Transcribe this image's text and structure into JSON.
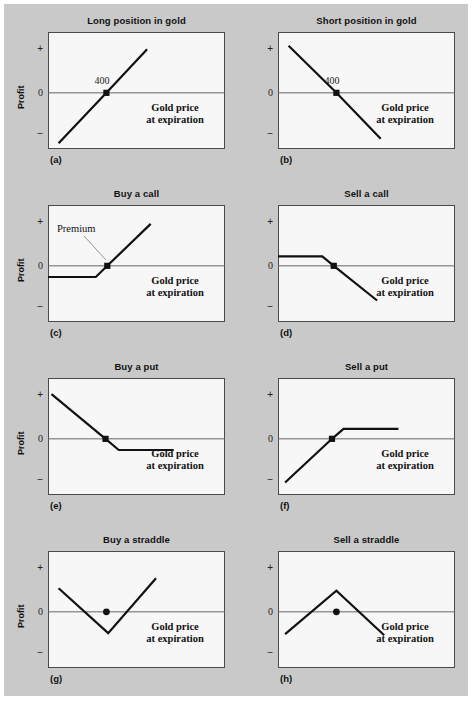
{
  "figure": {
    "background_color": "#c9c9c9",
    "plot_background_color": "#f7f7f7",
    "border_color": "#4a4a4a",
    "line_color": "#111111",
    "zero_line_color": "#666666"
  },
  "common": {
    "ylabel": "Profit",
    "tick_plus": "+",
    "tick_zero": "0",
    "tick_minus": "−",
    "x_axis_note_line1": "Gold price",
    "x_axis_note_line2": "at expiration",
    "strike_label": "400",
    "premium_label": "Premium"
  },
  "chart_data": [
    {
      "id": "a",
      "letter": "(a)",
      "type": "line",
      "title": "Long position in gold",
      "ylabel": "Profit",
      "xlabel": "Gold price at expiration",
      "show_ylabel": true,
      "show_strike_label": true,
      "show_premium": false,
      "ytick_labels": [
        "+",
        "0",
        "−"
      ],
      "ylim": [
        -1,
        1
      ],
      "grid": false,
      "legend": "none",
      "strike": 400,
      "marker_point": {
        "x": 0.33,
        "y": 0.0
      },
      "points": [
        {
          "x": 0.06,
          "y": -0.9
        },
        {
          "x": 0.33,
          "y": 0.0
        },
        {
          "x": 0.56,
          "y": 0.78
        }
      ]
    },
    {
      "id": "b",
      "letter": "(b)",
      "type": "line",
      "title": "Short position in gold",
      "ylabel": "Profit",
      "xlabel": "Gold price at expiration",
      "show_ylabel": false,
      "show_strike_label": true,
      "show_premium": false,
      "ytick_labels": [
        "+",
        "0",
        "−"
      ],
      "ylim": [
        -1,
        1
      ],
      "grid": false,
      "legend": "none",
      "strike": 400,
      "marker_point": {
        "x": 0.33,
        "y": 0.0
      },
      "points": [
        {
          "x": 0.06,
          "y": 0.84
        },
        {
          "x": 0.33,
          "y": 0.0
        },
        {
          "x": 0.58,
          "y": -0.82
        }
      ]
    },
    {
      "id": "c",
      "letter": "(c)",
      "type": "line",
      "title": "Buy a call",
      "ylabel": "Profit",
      "xlabel": "Gold price at expiration",
      "show_ylabel": true,
      "show_strike_label": false,
      "show_premium": true,
      "ytick_labels": [
        "+",
        "0",
        "−"
      ],
      "ylim": [
        -1,
        1
      ],
      "grid": false,
      "legend": "none",
      "marker_point": {
        "x": 0.335,
        "y": 0.0
      },
      "points": [
        {
          "x": 0.0,
          "y": -0.2
        },
        {
          "x": 0.27,
          "y": -0.2
        },
        {
          "x": 0.335,
          "y": 0.0
        },
        {
          "x": 0.58,
          "y": 0.75
        }
      ]
    },
    {
      "id": "d",
      "letter": "(d)",
      "type": "line",
      "title": "Sell a call",
      "ylabel": "Profit",
      "xlabel": "Gold price at expiration",
      "show_ylabel": false,
      "show_strike_label": false,
      "show_premium": false,
      "ytick_labels": [
        "+",
        "0",
        "−"
      ],
      "ylim": [
        -1,
        1
      ],
      "grid": false,
      "legend": "none",
      "marker_point": {
        "x": 0.315,
        "y": 0.0
      },
      "points": [
        {
          "x": 0.0,
          "y": 0.17
        },
        {
          "x": 0.25,
          "y": 0.17
        },
        {
          "x": 0.315,
          "y": 0.0
        },
        {
          "x": 0.56,
          "y": -0.62
        }
      ]
    },
    {
      "id": "e",
      "letter": "(e)",
      "type": "line",
      "title": "Buy a put",
      "ylabel": "Profit",
      "xlabel": "Gold price at expiration",
      "show_ylabel": true,
      "show_strike_label": false,
      "show_premium": false,
      "ytick_labels": [
        "+",
        "0",
        "−"
      ],
      "ylim": [
        -1,
        1
      ],
      "grid": false,
      "legend": "none",
      "marker_point": {
        "x": 0.325,
        "y": 0.0
      },
      "points": [
        {
          "x": 0.02,
          "y": 0.8
        },
        {
          "x": 0.325,
          "y": 0.0
        },
        {
          "x": 0.4,
          "y": -0.2
        },
        {
          "x": 0.71,
          "y": -0.2
        }
      ]
    },
    {
      "id": "f",
      "letter": "(f)",
      "type": "line",
      "title": "Sell a put",
      "ylabel": "Profit",
      "xlabel": "Gold price at expiration",
      "show_ylabel": false,
      "show_strike_label": false,
      "show_premium": false,
      "ytick_labels": [
        "+",
        "0",
        "−"
      ],
      "ylim": [
        -1,
        1
      ],
      "grid": false,
      "legend": "none",
      "marker_point": {
        "x": 0.305,
        "y": 0.0
      },
      "points": [
        {
          "x": 0.04,
          "y": -0.78
        },
        {
          "x": 0.305,
          "y": 0.0
        },
        {
          "x": 0.37,
          "y": 0.18
        },
        {
          "x": 0.68,
          "y": 0.18
        }
      ]
    },
    {
      "id": "g",
      "letter": "(g)",
      "type": "line",
      "title": "Buy a straddle",
      "ylabel": "Profit",
      "xlabel": "Gold price at expiration",
      "show_ylabel": true,
      "show_strike_label": false,
      "show_premium": false,
      "ytick_labels": [
        "+",
        "0",
        "−"
      ],
      "ylim": [
        -1,
        1
      ],
      "grid": false,
      "legend": "none",
      "marker_point": {
        "x": 0.33,
        "y": 0.0
      },
      "points": [
        {
          "x": 0.06,
          "y": 0.42
        },
        {
          "x": 0.34,
          "y": -0.38
        },
        {
          "x": 0.61,
          "y": 0.6
        }
      ]
    },
    {
      "id": "h",
      "letter": "(h)",
      "type": "line",
      "title": "Sell a straddle",
      "ylabel": "Profit",
      "xlabel": "Gold price at expiration",
      "show_ylabel": false,
      "show_strike_label": false,
      "show_premium": false,
      "ytick_labels": [
        "+",
        "0",
        "−"
      ],
      "ylim": [
        -1,
        1
      ],
      "grid": false,
      "legend": "none",
      "marker_point": {
        "x": 0.33,
        "y": 0.0
      },
      "points": [
        {
          "x": 0.04,
          "y": -0.4
        },
        {
          "x": 0.33,
          "y": 0.38
        },
        {
          "x": 0.6,
          "y": -0.42
        }
      ]
    }
  ]
}
